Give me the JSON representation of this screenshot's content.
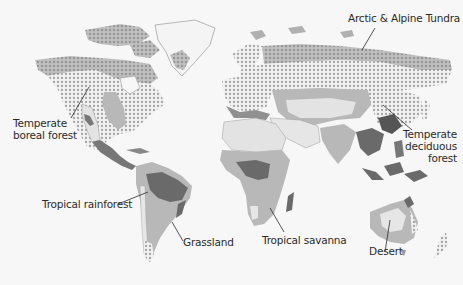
{
  "map": {
    "title": "World biomes",
    "colors": {
      "background": "#f7f7f7",
      "land_light": "#e6e6e6",
      "desert": "#dedede",
      "savanna_grassland": "#b9b9b9",
      "tundra": "#a9a9a9",
      "rainforest": "#6a6a6a",
      "boreal_dots": "#a0a0a0",
      "outline": "#9a9a9a"
    },
    "labels": [
      {
        "id": "arctic-tundra",
        "text": "Arctic & Alpine Tundra"
      },
      {
        "id": "temperate-boreal-1",
        "text": "Temperate"
      },
      {
        "id": "temperate-boreal-2",
        "text": "boreal forest"
      },
      {
        "id": "temperate-deciduous-1",
        "text": "Temperate"
      },
      {
        "id": "temperate-deciduous-2",
        "text": "deciduous"
      },
      {
        "id": "temperate-deciduous-3",
        "text": "forest"
      },
      {
        "id": "tropical-rainforest",
        "text": "Tropical rainforest"
      },
      {
        "id": "grassland",
        "text": "Grassland"
      },
      {
        "id": "tropical-savanna",
        "text": "Tropical savanna"
      },
      {
        "id": "desert",
        "text": "Desert"
      }
    ]
  }
}
